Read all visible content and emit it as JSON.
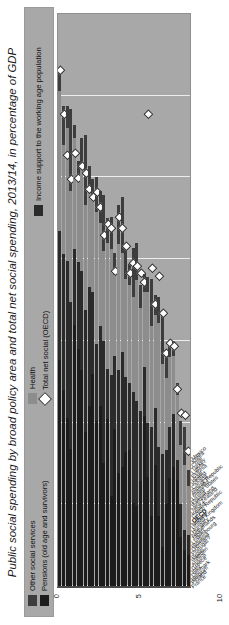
{
  "chart": {
    "title": "Public social spending by broad policy area and total net social spending, 2013/14, in percentage of GDP",
    "orientation": "rotated-90-ccw"
  },
  "legend": {
    "items": [
      {
        "label": "Other social services",
        "marker": "square",
        "color": "#3d3d3d"
      },
      {
        "label": "Pensions (old age and survivors)",
        "marker": "square",
        "color": "#1c1c1c"
      },
      {
        "label": "Health",
        "marker": "square",
        "color": "#8d8d8d"
      },
      {
        "label": "Total net social (OECD)",
        "marker": "diamond",
        "color": "#ffffff"
      },
      {
        "label": "Income support to the working age population",
        "marker": "square",
        "color": "#2b2b2b"
      }
    ]
  },
  "axis": {
    "ticks": [
      "35",
      "30",
      "25",
      "20",
      "15",
      "10",
      "5",
      "0"
    ],
    "min": 0,
    "max": 35,
    "unit": "% of GDP"
  },
  "chart_data": {
    "type": "bar",
    "title": "Public social spending by broad policy area and total net social spending, 2013/14, in percentage of GDP",
    "xlabel": "",
    "ylabel": "",
    "xlim": [
      0,
      35
    ],
    "ylim": [
      0,
      35
    ],
    "grid": true,
    "stacked": true,
    "legend_position": "top",
    "orientation": "horizontal",
    "categories": [
      "France",
      "Finland",
      "Belgium",
      "Denmark",
      "Italy",
      "Greece",
      "Austria",
      "Sweden",
      "Spain",
      "Portugal",
      "Germany",
      "Slovenia",
      "Luxembourg",
      "Japan",
      "Netherlands",
      "Hungary",
      "United Kingdom",
      "Norway",
      "OECD",
      "Czech Republic",
      "Ireland",
      "New Zealand",
      "Switzerland",
      "Poland",
      "United States",
      "Australia",
      "Slovak Republic",
      "Canada",
      "Iceland",
      "Israel",
      "Estonia",
      "Latvia",
      "Turkey",
      "Chile",
      "Korea",
      "Mexico"
    ],
    "series": [
      {
        "name": "Pensions (old age and survivors)",
        "color": "#1c1c1c",
        "values": [
          13.8,
          12.0,
          10.3,
          8.4,
          16.0,
          14.5,
          13.2,
          9.4,
          11.0,
          13.0,
          10.1,
          11.0,
          7.5,
          10.2,
          5.5,
          9.6,
          6.9,
          7.3,
          8.2,
          8.3,
          5.1,
          4.9,
          6.4,
          10.4,
          6.7,
          4.3,
          7.4,
          4.3,
          2.4,
          5.0,
          6.6,
          7.3,
          6.5,
          3.0,
          2.2,
          1.9
        ]
      },
      {
        "name": "Income support to the working age population",
        "color": "#2b2b2b",
        "values": [
          7.9,
          8.3,
          9.6,
          9.0,
          4.6,
          5.3,
          6.1,
          7.5,
          7.3,
          5.0,
          4.7,
          4.9,
          7.5,
          3.1,
          7.4,
          4.5,
          6.3,
          7.0,
          4.6,
          4.1,
          6.8,
          6.4,
          4.3,
          3.0,
          3.3,
          5.4,
          3.5,
          4.2,
          5.7,
          3.3,
          3.1,
          3.2,
          1.2,
          2.0,
          1.2,
          1.2
        ]
      },
      {
        "name": "Health",
        "color": "#8d8d8d",
        "values": [
          8.6,
          6.7,
          8.1,
          6.8,
          6.8,
          5.0,
          6.6,
          6.4,
          6.2,
          6.0,
          8.1,
          6.3,
          5.5,
          7.7,
          7.7,
          4.9,
          7.7,
          6.1,
          6.0,
          6.0,
          5.8,
          7.4,
          6.3,
          4.6,
          8.0,
          6.2,
          5.7,
          7.6,
          5.5,
          4.4,
          4.3,
          3.6,
          4.0,
          3.6,
          4.0,
          3.0
        ]
      },
      {
        "name": "Other social services",
        "color": "#3d3d3d",
        "values": [
          1.4,
          2.4,
          1.4,
          5.0,
          0.8,
          1.2,
          1.5,
          4.3,
          1.2,
          0.9,
          2.1,
          2.0,
          3.4,
          1.5,
          2.0,
          1.4,
          2.4,
          3.4,
          2.2,
          1.3,
          3.0,
          2.3,
          1.4,
          1.1,
          0.9,
          2.9,
          1.2,
          1.6,
          3.1,
          1.6,
          1.0,
          0.9,
          0.7,
          1.5,
          2.3,
          1.0
        ]
      }
    ],
    "total_net_social_oecd": {
      "name": "Total net social (OECD)",
      "marker": "diamond",
      "color": "#ffffff",
      "values": [
        31.5,
        28.8,
        26.3,
        24.8,
        26.4,
        24.9,
        25.6,
        25.2,
        24.2,
        23.7,
        24.0,
        23.1,
        21.4,
        22.1,
        21.8,
        19.2,
        22.5,
        21.8,
        20.7,
        19.1,
        19.7,
        19.5,
        19.1,
        18.5,
        28.8,
        19.4,
        17.2,
        18.9,
        16.6,
        14.2,
        14.8,
        14.6,
        12.0,
        10.5,
        10.4,
        8.2
      ]
    }
  }
}
